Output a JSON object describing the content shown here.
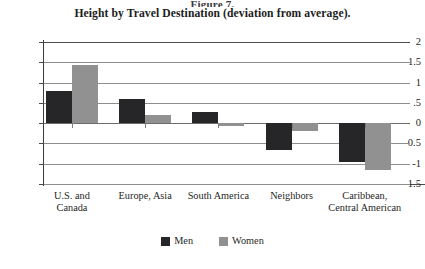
{
  "figure": {
    "number": "Figure 7.",
    "title": "Height by Travel Destination (deviation from average)."
  },
  "legend": {
    "men_label": "Men",
    "women_label": "Women",
    "men_color": "#262628",
    "women_color": "#919191"
  },
  "axis": {
    "y_ticks": [
      "2",
      "1.5",
      "1",
      ".5",
      "0",
      "-0.5",
      "-1",
      "-1.5"
    ],
    "y_tick_values": [
      2,
      1.5,
      1,
      0.5,
      0,
      -0.5,
      -1,
      -1.5
    ]
  },
  "chart_data": {
    "type": "bar",
    "title": "Height by Travel Destination (deviation from average).",
    "xlabel": "",
    "ylabel": "",
    "ylim": [
      -1.5,
      2
    ],
    "grid": true,
    "legend_position": "bottom",
    "categories": [
      "U.S. and\nCanada",
      "Europe, Asia",
      "South America",
      "Neighbors",
      "Caribbean,\nCentral American"
    ],
    "series": [
      {
        "name": "Men",
        "color": "#262628",
        "values": [
          0.8,
          0.6,
          0.28,
          -0.65,
          -0.95
        ]
      },
      {
        "name": "Women",
        "color": "#919191",
        "values": [
          1.43,
          0.2,
          -0.08,
          -0.2,
          -1.15
        ]
      }
    ]
  }
}
